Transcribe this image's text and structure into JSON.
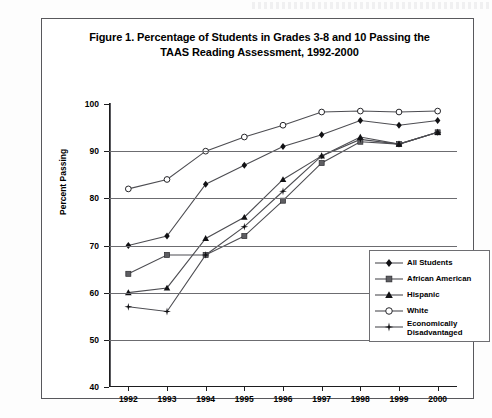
{
  "page": {
    "bleed_artifact_label": "illegible-scan-bleedthrough"
  },
  "figure": {
    "title_line1": "Figure 1. Percentage of Students in Grades 3-8 and 10 Passing the",
    "title_line2": "TAAS Reading Assessment, 1992-2000"
  },
  "axes": {
    "y_axis_title": "Percent Passing",
    "y_tick_labels": [
      "100",
      "90",
      "80",
      "70",
      "60",
      "50",
      "40"
    ],
    "x_tick_labels": [
      "1992",
      "1993",
      "1994",
      "1995",
      "1996",
      "1997",
      "1998",
      "1999",
      "2000"
    ]
  },
  "legend": {
    "items": [
      {
        "label": "All Students",
        "marker": "diamond-marker-icon",
        "color": "#111114"
      },
      {
        "label": "African American",
        "marker": "square-marker-icon",
        "color": "#5e5e62"
      },
      {
        "label": "Hispanic",
        "marker": "triangle-marker-icon",
        "color": "#111114"
      },
      {
        "label": "White",
        "marker": "open-circle-marker-icon",
        "color": "#ffffff"
      },
      {
        "label": "Economically\nDisadvantaged",
        "marker": "star-marker-icon",
        "color": "#111114"
      },
      {
        "label_line1": "Economically",
        "label_line2": "Disadvantaged"
      }
    ]
  },
  "chart_data": {
    "type": "line",
    "title": "Figure 1. Percentage of Students in Grades 3-8 and 10 Passing the TAAS Reading Assessment, 1992-2000",
    "xlabel": "",
    "ylabel": "Percent Passing",
    "x": [
      "1992",
      "1993",
      "1994",
      "1995",
      "1996",
      "1997",
      "1998",
      "1999",
      "2000"
    ],
    "ylim": [
      40,
      100
    ],
    "ytick_step": 10,
    "grid": "horizontal",
    "legend_position": "inside-bottom-right",
    "series": [
      {
        "name": "All Students",
        "marker": "diamond",
        "values": [
          70,
          72,
          83,
          87,
          91,
          93.5,
          96.5,
          95.5,
          96.5
        ]
      },
      {
        "name": "African American",
        "marker": "square",
        "values": [
          64,
          68,
          68,
          72,
          79.5,
          87.5,
          92,
          91.5,
          94
        ]
      },
      {
        "name": "Hispanic",
        "marker": "triangle",
        "values": [
          60,
          61,
          71.5,
          76,
          84,
          89,
          93,
          91.5,
          94
        ]
      },
      {
        "name": "White",
        "marker": "open-circle",
        "values": [
          82,
          84,
          90,
          93,
          95.5,
          98.3,
          98.5,
          98.3,
          98.5
        ]
      },
      {
        "name": "Economically Disadvantaged",
        "marker": "star",
        "values": [
          57,
          56,
          68,
          74,
          81.5,
          89,
          92.5,
          91.5,
          94
        ]
      }
    ]
  }
}
